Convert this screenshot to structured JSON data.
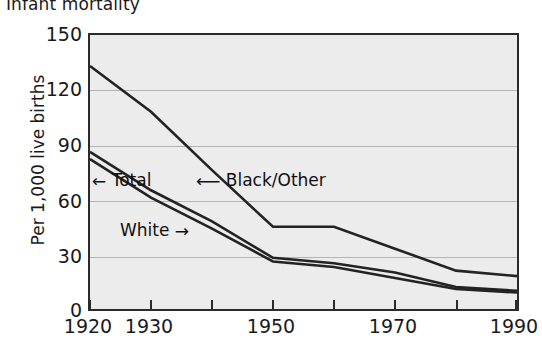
{
  "chart_data": {
    "type": "line",
    "title": "Infant mortality",
    "xlabel": "",
    "ylabel": "Per 1,000 live births",
    "xlim": [
      1920,
      1990
    ],
    "ylim": [
      0,
      150
    ],
    "yticks": [
      0,
      30,
      60,
      90,
      120,
      150
    ],
    "ytick_labels": [
      "0",
      "30",
      "60",
      "90",
      "120",
      "150"
    ],
    "xticks": [
      1920,
      1930,
      1940,
      1950,
      1960,
      1970,
      1980,
      1990
    ],
    "xtick_labels": [
      "1920",
      "1930",
      "",
      "1950",
      "",
      "1970",
      "",
      "1990"
    ],
    "labeled_xticks": [
      {
        "value": 1920,
        "label": "1920"
      },
      {
        "value": 1930,
        "label": "1930"
      },
      {
        "value": 1950,
        "label": "1950"
      },
      {
        "value": 1970,
        "label": "1970"
      },
      {
        "value": 1990,
        "label": "1990"
      }
    ],
    "grid": true,
    "grid_axis": "y",
    "legend": "inline-annotations",
    "x": [
      1920,
      1930,
      1940,
      1950,
      1960,
      1970,
      1980,
      1990
    ],
    "series": [
      {
        "name": "Black/Other",
        "values": [
          133,
          108,
          76,
          45,
          45,
          33,
          21,
          18
        ]
      },
      {
        "name": "Total",
        "values": [
          86,
          65,
          48,
          28,
          25,
          20,
          12,
          10
        ]
      },
      {
        "name": "White",
        "values": [
          82,
          61,
          44,
          26,
          23,
          17,
          11,
          9
        ]
      }
    ],
    "annotations": [
      {
        "text": "Total",
        "arrow": "left",
        "x_px": 120,
        "y_px": 181
      },
      {
        "text": "Black/Other",
        "arrow": "left",
        "x_px": 225,
        "y_px": 181
      },
      {
        "text": "White",
        "arrow": "right",
        "x_px": 118,
        "y_px": 230
      }
    ]
  },
  "axis": {
    "y_label": "Per 1,000 live births",
    "y_ticks": [
      "150",
      "120",
      "90",
      "60",
      "30",
      "0"
    ],
    "x_ticks": [
      "1920",
      "1930",
      "1950",
      "1970",
      "1990"
    ]
  },
  "annotations": {
    "total": "Total",
    "black_other": "Black/Other",
    "white": "White",
    "arrow_left": "←",
    "arrow_right": "→",
    "arrow_long_left": "⟵"
  },
  "colors": {
    "plot_background": "#ececec",
    "frame": "#2b2b2b",
    "gridline": "#b4b4b4",
    "line": "#232323",
    "text": "#1a1a1a",
    "page_background": "#ffffff"
  }
}
